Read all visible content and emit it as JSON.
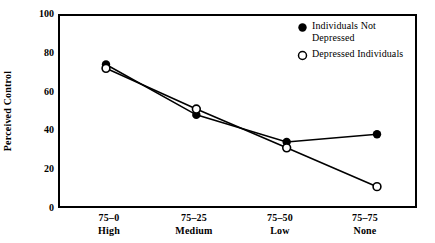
{
  "chart_data": {
    "type": "line",
    "title": "",
    "xlabel": "",
    "ylabel": "Perceived Control",
    "ylim": [
      0,
      100
    ],
    "yticks": [
      0,
      20,
      40,
      60,
      80,
      100
    ],
    "grid": false,
    "legend_position": "top-right",
    "categories": [
      "75-0",
      "75-25",
      "75-50",
      "75-75"
    ],
    "category_sublabels": [
      "High",
      "Medium",
      "Low",
      "None"
    ],
    "series": [
      {
        "name": "Individuals Not Depressed",
        "marker": "filled-circle",
        "color": "#000000",
        "values": [
          74,
          48,
          34,
          38
        ]
      },
      {
        "name": "Depressed Individuals",
        "marker": "open-circle",
        "color": "#000000",
        "values": [
          72,
          51,
          31,
          11
        ]
      }
    ]
  },
  "axes": {
    "y_title": "Perceived Control",
    "y_tick_labels": [
      "100",
      "80",
      "60",
      "40",
      "20",
      "0"
    ],
    "x_tick_labels": [
      {
        "line1": "75–0",
        "line2": "High"
      },
      {
        "line1": "75–25",
        "line2": "Medium"
      },
      {
        "line1": "75–50",
        "line2": "Low"
      },
      {
        "line1": "75–75",
        "line2": "None"
      }
    ]
  },
  "legend": {
    "items": [
      {
        "label_line1": "Individuals Not",
        "label_line2": "Depressed",
        "marker": "filled-circle-icon"
      },
      {
        "label_line1": "Depressed Individuals",
        "label_line2": "",
        "marker": "open-circle-icon"
      }
    ]
  }
}
